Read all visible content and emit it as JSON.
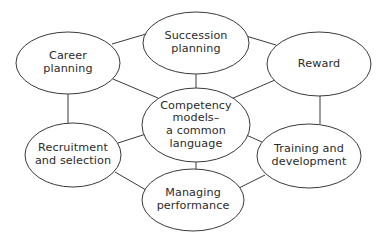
{
  "diagram": {
    "type": "concept-map",
    "center": {
      "id": "competency",
      "label_lines": [
        "Competency",
        "models–",
        "a common",
        "language"
      ],
      "shape": {
        "cx": 196,
        "cy": 125,
        "rx": 54,
        "ry": 37
      }
    },
    "nodes": [
      {
        "id": "career",
        "label_lines": [
          "Career",
          "planning"
        ],
        "shape": {
          "cx": 68,
          "cy": 63,
          "rx": 52,
          "ry": 31
        }
      },
      {
        "id": "succession",
        "label_lines": [
          "Succession",
          "planning"
        ],
        "shape": {
          "cx": 196,
          "cy": 43,
          "rx": 53,
          "ry": 31
        }
      },
      {
        "id": "reward",
        "label_lines": [
          "Reward"
        ],
        "shape": {
          "cx": 319,
          "cy": 64,
          "rx": 52,
          "ry": 32
        }
      },
      {
        "id": "recruitment",
        "label_lines": [
          "Recruitment",
          "and selection"
        ],
        "shape": {
          "cx": 73,
          "cy": 155,
          "rx": 48,
          "ry": 32
        }
      },
      {
        "id": "training",
        "label_lines": [
          "Training and",
          "development"
        ],
        "shape": {
          "cx": 309,
          "cy": 156,
          "rx": 52,
          "ry": 32
        }
      },
      {
        "id": "managing",
        "label_lines": [
          "Managing",
          "performance"
        ],
        "shape": {
          "cx": 193,
          "cy": 200,
          "rx": 51,
          "ry": 31
        }
      }
    ],
    "edges": [
      {
        "from": "career",
        "to": "succession"
      },
      {
        "from": "succession",
        "to": "reward"
      },
      {
        "from": "reward",
        "to": "training"
      },
      {
        "from": "training",
        "to": "managing"
      },
      {
        "from": "managing",
        "to": "recruitment"
      },
      {
        "from": "recruitment",
        "to": "career"
      },
      {
        "from": "competency",
        "to": "career"
      },
      {
        "from": "competency",
        "to": "succession"
      },
      {
        "from": "competency",
        "to": "reward"
      },
      {
        "from": "competency",
        "to": "recruitment"
      },
      {
        "from": "competency",
        "to": "training"
      },
      {
        "from": "competency",
        "to": "managing"
      }
    ],
    "colors": {
      "stroke": "#3a3a3a",
      "fill": "#ffffff",
      "text": "#2b2b2b",
      "background": "#ffffff"
    }
  }
}
